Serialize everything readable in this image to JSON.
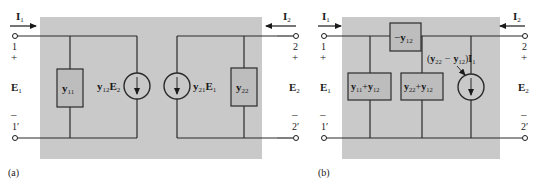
{
  "colors": {
    "panel": "#c9c9c9",
    "line": "#2a2a2a",
    "box_fill": "#bdbdbd"
  },
  "figure_a": {
    "caption": "(a)",
    "port1": {
      "current": "I",
      "current_sub": "1",
      "terminal_top": "1",
      "plus": "+",
      "voltage": "E",
      "voltage_sub": "1",
      "minus": "–",
      "terminal_bottom": "1′"
    },
    "port2": {
      "current": "I",
      "current_sub": "2",
      "terminal_top": "2",
      "plus": "+",
      "voltage": "E",
      "voltage_sub": "2",
      "minus": "–",
      "terminal_bottom": "2′"
    },
    "admittance_11": {
      "y": "y",
      "sub": "11"
    },
    "source_12": {
      "y": "y",
      "sub": "12",
      "E": "E",
      "E_sub": "2"
    },
    "source_21": {
      "y": "y",
      "sub": "21",
      "E": "E",
      "E_sub": "1"
    },
    "admittance_22": {
      "y": "y",
      "sub": "22"
    }
  },
  "figure_b": {
    "caption": "(b)",
    "port1": {
      "current": "I",
      "current_sub": "1",
      "terminal_top": "1",
      "plus": "+",
      "voltage": "E",
      "voltage_sub": "1",
      "minus": "–",
      "terminal_bottom": "1′"
    },
    "port2": {
      "current": "I",
      "current_sub": "2",
      "terminal_top": "2",
      "plus": "+",
      "voltage": "E",
      "voltage_sub": "2",
      "minus": "–",
      "terminal_bottom": "2′"
    },
    "series_box": {
      "prefix": "−",
      "y": "y",
      "sub": "12"
    },
    "shunt_left": {
      "y1": "y",
      "sub1": "11",
      "op": "+",
      "y2": "y",
      "sub2": "12"
    },
    "shunt_right": {
      "y1": "y",
      "sub1": "22",
      "op": "+",
      "y2": "y",
      "sub2": "12"
    },
    "source": {
      "open": "(",
      "y1": "y",
      "sub1": "22",
      "op": "−",
      "y2": "y",
      "sub2": "12",
      "close": ")",
      "I": "I",
      "I_sub": "1"
    }
  }
}
